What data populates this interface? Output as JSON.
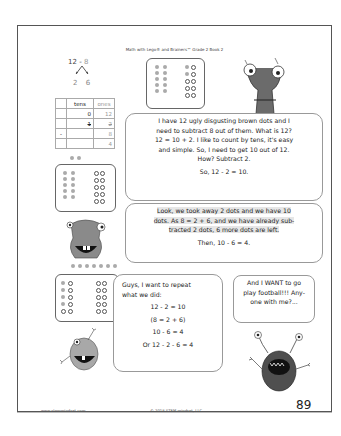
{
  "header": {
    "title": "Math with Lego® and Brainers™ Grade 2 Book 2"
  },
  "decomposition": {
    "expression_a": "12",
    "expression_op": " - ",
    "expression_b": "8",
    "part_1": "2",
    "part_2": "6"
  },
  "place_value_table": {
    "headers": [
      "",
      "tens",
      "ones"
    ],
    "rows": [
      [
        "",
        "0",
        "12"
      ],
      [
        "",
        "1",
        "2"
      ],
      [
        "-",
        "",
        "8"
      ],
      [
        "",
        "",
        "4"
      ]
    ]
  },
  "bubbles": {
    "first": {
      "lines": [
        "I have 12 ugly disgusting brown dots and I",
        "need to subtract 8 out of them. What is 12?",
        "12 = 10 + 2. I like to count by tens, it's easy",
        "and simple. So, I need to get 10 out of 12.",
        "How? Subtract 2."
      ],
      "conclusion": "So, 12 - 2 = 10."
    },
    "second": {
      "lines": [
        "Look, we took away 2 dots and we have 10",
        "dots. As 8 = 2 + 6, and we have already sub-",
        "tracted 2 dots, 6 more dots are left."
      ],
      "conclusion": "Then, 10 - 6 = 4."
    },
    "third": {
      "intro_1": "Guys, I want to repeat",
      "intro_2": "what we did:",
      "steps": [
        "12 - 2 = 10",
        "(8 = 2 + 6)",
        "10 - 6 = 4",
        "Or 12 - 2 - 6 = 4"
      ]
    },
    "fourth": {
      "lines": [
        "And I WANT to go",
        "play football!!! Any-",
        "one with me?..."
      ]
    }
  },
  "dot_boxes": {
    "box1": {
      "left": [
        "f",
        "f",
        "f",
        "f",
        "f",
        "f",
        "f",
        "f",
        "f",
        "f"
      ],
      "right": [
        "f",
        "o",
        "f",
        "o",
        "o",
        "o",
        "o",
        "o",
        "o",
        "o"
      ]
    },
    "box2": {
      "left": [
        "f",
        "f",
        "f",
        "f",
        "f",
        "f",
        "f",
        "f",
        "f",
        "f"
      ],
      "right": [
        "o",
        "o",
        "o",
        "o",
        "o",
        "o",
        "o",
        "o",
        "o",
        "o"
      ]
    },
    "box3": {
      "left": [
        "f",
        "o",
        "f",
        "o",
        "f",
        "o",
        "f",
        "o",
        "o",
        "o"
      ],
      "right": [
        "o",
        "o",
        "o",
        "o",
        "o",
        "o",
        "o",
        "o",
        "o",
        "o"
      ]
    }
  },
  "footer": {
    "website": "www.stemmindset.com",
    "copyright": "© 2018 STEM mindset, LLC",
    "page_number": "89"
  },
  "colors": {
    "dot_filled": "#aaaaaa",
    "outline": "#555555",
    "monster_gray": "#6b6b6b"
  }
}
